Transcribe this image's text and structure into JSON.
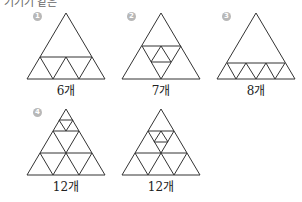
{
  "header": {
    "text": "기기기 같은"
  },
  "figures": [
    {
      "number": "1",
      "label": "6개"
    },
    {
      "number": "2",
      "label": "7개"
    },
    {
      "number": "3",
      "label": "8개"
    },
    {
      "number": "4",
      "label": "12개"
    },
    {
      "number": "",
      "label": "12개"
    }
  ],
  "colors": {
    "stroke": "#333333",
    "badge": "#b8b8b8"
  }
}
